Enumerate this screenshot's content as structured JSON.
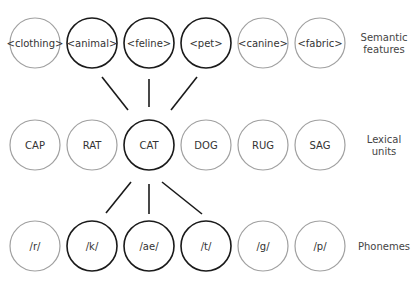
{
  "colors": {
    "active": "#1a1a1a",
    "inactive": "#a0a0a0",
    "line": "#1a1a1a"
  },
  "rows": [
    {
      "name": "semantic-features",
      "label_lines": [
        "Semantic",
        "features"
      ],
      "cy": 43,
      "nodes": [
        {
          "text": "<clothing>",
          "active": false
        },
        {
          "text": "<animal>",
          "active": true
        },
        {
          "text": "<feline>",
          "active": true
        },
        {
          "text": "<pet>",
          "active": true
        },
        {
          "text": "<canine>",
          "active": false
        },
        {
          "text": "<fabric>",
          "active": false
        }
      ]
    },
    {
      "name": "lexical-units",
      "label_lines": [
        "Lexical",
        "units"
      ],
      "cy": 145,
      "nodes": [
        {
          "text": "CAP",
          "active": false
        },
        {
          "text": "RAT",
          "active": false
        },
        {
          "text": "CAT",
          "active": true
        },
        {
          "text": "DOG",
          "active": false
        },
        {
          "text": "RUG",
          "active": false
        },
        {
          "text": "SAG",
          "active": false
        }
      ]
    },
    {
      "name": "phonemes",
      "label_lines": [
        "Phonemes"
      ],
      "cy": 246,
      "nodes": [
        {
          "text": "/r/",
          "active": false
        },
        {
          "text": "/k/",
          "active": true
        },
        {
          "text": "/ae/",
          "active": true
        },
        {
          "text": "/t/",
          "active": true
        },
        {
          "text": "/g/",
          "active": false
        },
        {
          "text": "/p/",
          "active": false
        }
      ]
    }
  ]
}
